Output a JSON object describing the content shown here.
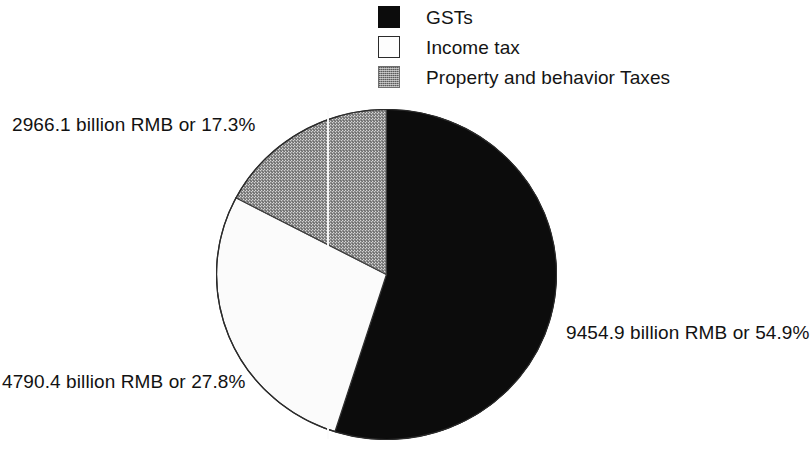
{
  "legend": {
    "items": [
      {
        "label": "GSTs",
        "swatch": "solid-black-swatch-icon",
        "color": "#0c0c0c"
      },
      {
        "label": "Income tax",
        "swatch": "outlined-white-swatch-icon",
        "color": "#fdfdfd"
      },
      {
        "label": "Property and behavior Taxes",
        "swatch": "stippled-gray-swatch-icon",
        "color": "#8d8d8d"
      }
    ]
  },
  "labels": {
    "gsts": "9454.9 billion RMB or 54.9%",
    "income_tax": "4790.4 billion RMB or 27.8%",
    "property": "2966.1 billion RMB or 17.3%"
  },
  "chart_data": {
    "type": "pie",
    "title": "",
    "categories": [
      "GSTs",
      "Income tax",
      "Property and behavior Taxes"
    ],
    "values": [
      9454.9,
      4790.4,
      2966.1
    ],
    "percentages": [
      54.9,
      27.8,
      17.3
    ],
    "units": "billion RMB",
    "data_labels": [
      "9454.9 billion RMB or 54.9%",
      "4790.4 billion RMB or 27.8%",
      "2966.1 billion RMB or 17.3%"
    ],
    "colors": [
      "#0c0c0c",
      "#fdfdfd",
      "#8d8d8d"
    ],
    "legend": [
      "GSTs",
      "Income tax",
      "Property and behavior Taxes"
    ],
    "legend_position": "top-center",
    "start_angle_deg": 0,
    "direction": "clockwise",
    "grid": false
  }
}
